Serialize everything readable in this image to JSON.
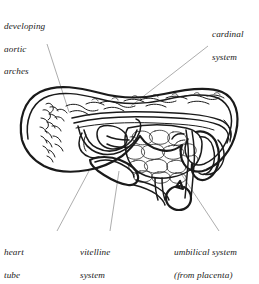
{
  "figure": {
    "background_color": "#ffffff",
    "ink_color": "#1a1a1a",
    "leader_line_color": "#8a8a8a"
  },
  "labels": {
    "aortic_arches": {
      "name": "developing-aortic-arches",
      "lines": [
        "developing",
        "aortic",
        "arches"
      ],
      "text": "developing aortic arches"
    },
    "cardinal": {
      "name": "cardinal-system",
      "lines": [
        "cardinal",
        "system"
      ],
      "text": "cardinal system"
    },
    "heart_tube": {
      "name": "heart-tube",
      "lines": [
        "heart",
        "tube"
      ],
      "text": "heart tube"
    },
    "vitelline": {
      "name": "vitelline-system",
      "lines": [
        "vitelline",
        "system"
      ],
      "text": "vitelline system"
    },
    "umbilical": {
      "name": "umbilical-system",
      "lines": [
        "umbilical system",
        "(from placenta)"
      ],
      "text": "umbilical system (from placenta)"
    }
  }
}
